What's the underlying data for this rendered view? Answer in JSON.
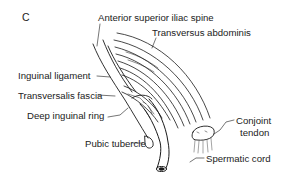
{
  "figure": {
    "panel_letter": "C",
    "labels": {
      "asis": "Anterior superior iliac spine",
      "transversus": "Transversus abdominis",
      "inguinal_ligament": "Inguinal ligament",
      "transversalis_fascia": "Transversalis fascia",
      "deep_ring": "Deep inguinal ring",
      "pubic_tubercle": "Pubic tubercle",
      "conjoint_1": "Conjoint",
      "conjoint_2": "tendon",
      "spermatic_cord": "Spermatic cord"
    },
    "colors": {
      "ink": "#1a1a1a",
      "background": "#ffffff"
    }
  }
}
